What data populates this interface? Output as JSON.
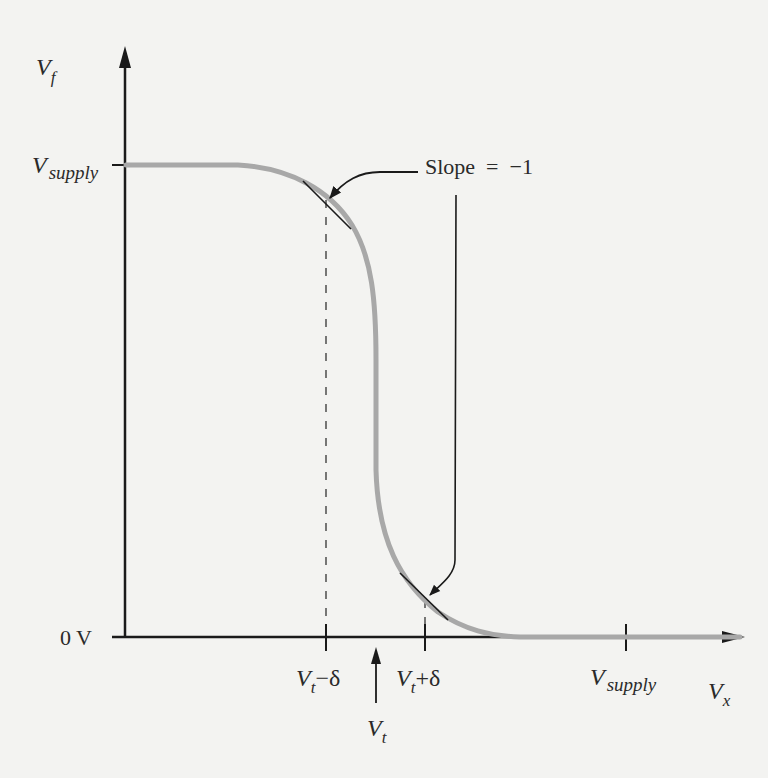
{
  "figure": {
    "type": "transfer-characteristic",
    "y_axis": {
      "label": "V",
      "label_sub": "f"
    },
    "x_axis": {
      "label": "V",
      "label_sub": "x"
    },
    "y_ticks": [
      {
        "main": "V",
        "sub": "supply"
      },
      {
        "main": "0 V",
        "sub": ""
      }
    ],
    "x_ticks": [
      {
        "main": "V",
        "sub": "t",
        "suffix": "−δ"
      },
      {
        "main": "V",
        "sub": "t",
        "suffix": "+δ"
      },
      {
        "main": "V",
        "sub": "supply",
        "suffix": ""
      }
    ],
    "vt_marker": {
      "main": "V",
      "sub": "t"
    },
    "annotation": {
      "text": "Slope  =  −1"
    }
  },
  "colors": {
    "axis": "#1a1a1a",
    "curve": "#a8a8a8",
    "background": "#f3f3f1"
  }
}
